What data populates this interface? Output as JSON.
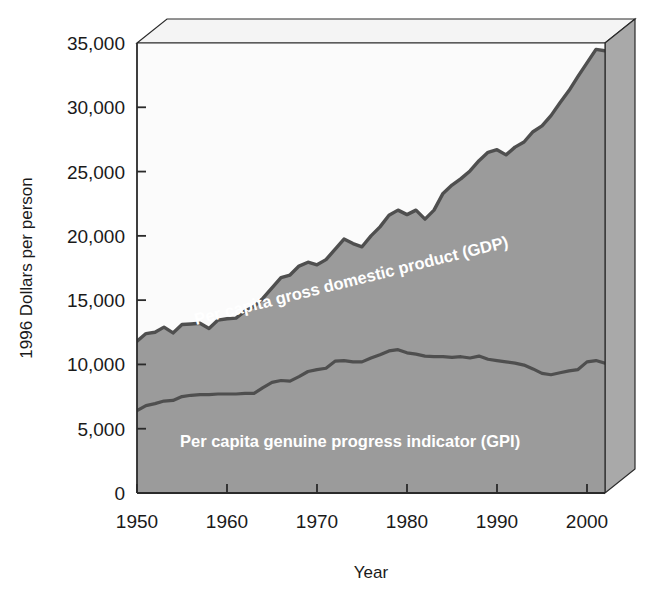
{
  "chart_data": {
    "type": "area",
    "title": "",
    "subtitle": "",
    "xlabel": "Year",
    "ylabel": "1996 Dollars per person",
    "xlim": [
      1950,
      2002
    ],
    "ylim": [
      0,
      35000
    ],
    "grid": false,
    "legend_position": "inline-annotations",
    "style": "stacked-band 3D block",
    "xticks": [
      1950,
      1960,
      1970,
      1980,
      1990,
      2000
    ],
    "xtick_labels": [
      "1950",
      "1960",
      "1970",
      "1980",
      "1990",
      "2000"
    ],
    "yticks": [
      0,
      5000,
      10000,
      15000,
      20000,
      25000,
      30000,
      35000
    ],
    "ytick_labels": [
      "0",
      "5,000",
      "10,000",
      "15,000",
      "20,000",
      "25,000",
      "30,000",
      "35,000"
    ],
    "annotations": [
      {
        "name": "gdp-series-label",
        "text": "Per capita gross domestic product (GDP)",
        "rotation_deg": -14
      },
      {
        "name": "gpi-series-label",
        "text": "Per capita genuine progress indicator (GPI)",
        "rotation_deg": 0
      }
    ],
    "colors": {
      "gdp_band_fill": "#9b9b9b",
      "gpi_band_fill": "#9b9b9b",
      "curve_outline": "#4a4a4a",
      "plot_background": "#fbfbfb",
      "block_top_face": "#f2f2f2",
      "block_side_face": "#a8a8a8",
      "axis_line": "#2a2a2a",
      "text": "#1a1a1a",
      "annotation_text": "#ffffff"
    },
    "x": [
      1950,
      1951,
      1952,
      1953,
      1954,
      1955,
      1956,
      1957,
      1958,
      1959,
      1960,
      1961,
      1962,
      1963,
      1964,
      1965,
      1966,
      1967,
      1968,
      1969,
      1970,
      1971,
      1972,
      1973,
      1974,
      1975,
      1976,
      1977,
      1978,
      1979,
      1980,
      1981,
      1982,
      1983,
      1984,
      1985,
      1986,
      1987,
      1988,
      1989,
      1990,
      1991,
      1992,
      1993,
      1994,
      1995,
      1996,
      1997,
      1998,
      1999,
      2000,
      2001,
      2002
    ],
    "series": [
      {
        "name": "Per capita gross domestic product (GDP)",
        "label": "Per capita gross domestic product (GDP)",
        "units": "1996 dollars per person",
        "values": [
          11800,
          12400,
          12500,
          12900,
          12450,
          13100,
          13150,
          13200,
          12800,
          13450,
          13550,
          13600,
          14150,
          14500,
          15150,
          15950,
          16750,
          16950,
          17650,
          17950,
          17750,
          18150,
          18950,
          19750,
          19400,
          19150,
          20000,
          20700,
          21600,
          22000,
          21650,
          22000,
          21300,
          22000,
          23300,
          23950,
          24450,
          25050,
          25850,
          26500,
          26700,
          26300,
          26900,
          27300,
          28100,
          28550,
          29350,
          30350,
          31300,
          32400,
          33450,
          34500,
          34400
        ]
      },
      {
        "name": "Per capita genuine progress indicator (GPI)",
        "label": "Per capita genuine progress indicator (GPI)",
        "units": "1996 dollars per person",
        "values": [
          6400,
          6800,
          6950,
          7150,
          7200,
          7500,
          7600,
          7650,
          7650,
          7700,
          7700,
          7700,
          7750,
          7750,
          8200,
          8600,
          8750,
          8700,
          9050,
          9450,
          9600,
          9700,
          10250,
          10300,
          10200,
          10200,
          10500,
          10750,
          11050,
          11150,
          10900,
          10800,
          10650,
          10600,
          10600,
          10550,
          10600,
          10500,
          10650,
          10400,
          10300,
          10200,
          10100,
          9950,
          9650,
          9300,
          9200,
          9350,
          9500,
          9600,
          10200,
          10300,
          10100
        ]
      }
    ]
  },
  "axes": {
    "y_axis_title": "1996 Dollars per person",
    "x_axis_title": "Year"
  }
}
